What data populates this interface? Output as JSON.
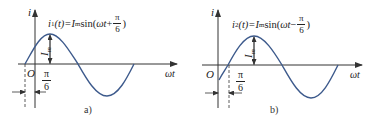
{
  "figure": {
    "panels": [
      {
        "id": "a",
        "caption": "a)",
        "equation": {
          "lhs": "i",
          "lhs_sub": "1",
          "lhs_arg": "(t)=",
          "amp": "I",
          "amp_sub": "m",
          "func": "sin(",
          "arg": "ωt",
          "sign": "+",
          "frac_num": "π",
          "frac_den": "6",
          "close": ")"
        },
        "y_axis_label": "i",
        "x_axis_label": "ωt",
        "origin_label": "O",
        "amplitude_label": "I",
        "amplitude_sub": "m",
        "phase_label_num": "π",
        "phase_label_den": "6",
        "phase_shift": "+π/6"
      },
      {
        "id": "b",
        "caption": "b)",
        "equation": {
          "lhs": "i",
          "lhs_sub": "2",
          "lhs_arg": "(t)=",
          "amp": "I",
          "amp_sub": "m",
          "func": "sin(",
          "arg": "ωt",
          "sign": "−",
          "frac_num": "π",
          "frac_den": "6",
          "close": ")"
        },
        "y_axis_label": "i",
        "x_axis_label": "ωt",
        "origin_label": "O",
        "amplitude_label": "I",
        "amplitude_sub": "m",
        "phase_label_num": "π",
        "phase_label_den": "6",
        "phase_shift": "−π/6"
      }
    ],
    "colors": {
      "curve": "#3d5a8c",
      "axis": "#333333",
      "text": "#222222"
    }
  }
}
